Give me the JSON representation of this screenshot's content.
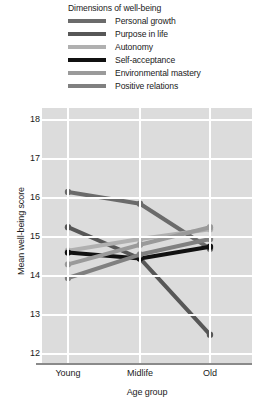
{
  "legend": {
    "title": "Dimensions of well-being",
    "entries": [
      {
        "label": "Personal growth",
        "color": "#6b6b6b"
      },
      {
        "label": "Purpose in life",
        "color": "#575757"
      },
      {
        "label": "Autonomy",
        "color": "#b0b0b0"
      },
      {
        "label": "Self-acceptance",
        "color": "#111111"
      },
      {
        "label": "Environmental mastery",
        "color": "#9a9a9a"
      },
      {
        "label": "Positive relations",
        "color": "#808080"
      }
    ]
  },
  "chart_data": {
    "type": "line",
    "title": "Dimensions of well-being",
    "xlabel": "Age group",
    "ylabel": "Mean well-being score",
    "categories": [
      "Young",
      "Midlife",
      "Old"
    ],
    "yticks": [
      12,
      13,
      14,
      15,
      16,
      17,
      18
    ],
    "ylim": [
      11.75,
      18.3
    ],
    "grid": true,
    "legend_position": "top",
    "series": [
      {
        "name": "Personal growth",
        "color": "#6b6b6b",
        "values": [
          16.15,
          15.85,
          14.7
        ]
      },
      {
        "name": "Purpose in life",
        "color": "#575757",
        "values": [
          15.25,
          14.45,
          12.5
        ]
      },
      {
        "name": "Autonomy",
        "color": "#b0b0b0",
        "values": [
          14.65,
          14.95,
          15.2
        ]
      },
      {
        "name": "Self-acceptance",
        "color": "#111111",
        "values": [
          14.6,
          14.45,
          14.75
        ]
      },
      {
        "name": "Environmental mastery",
        "color": "#9a9a9a",
        "values": [
          14.3,
          14.8,
          15.25
        ]
      },
      {
        "name": "Positive relations",
        "color": "#808080",
        "values": [
          13.95,
          14.55,
          14.95
        ]
      }
    ]
  },
  "axes": {
    "y_tick_labels": [
      "18",
      "17",
      "16",
      "15",
      "14",
      "13",
      "12"
    ],
    "x_tick_labels": [
      "Young",
      "Midlife",
      "Old"
    ],
    "x_axis_title": "Age group",
    "y_axis_title": "Mean well-being score"
  },
  "colors": {
    "plot_background": "#dcdcdc",
    "gridline": "#ffffff",
    "axis_line": "#8a8a8a",
    "text": "#1a1a1a"
  }
}
